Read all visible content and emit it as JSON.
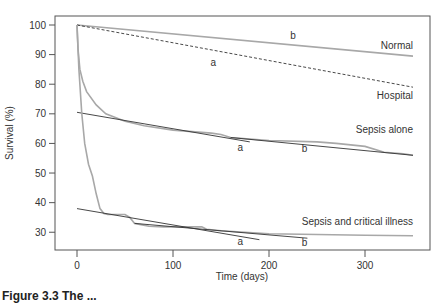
{
  "chart_data": {
    "type": "line",
    "title": "",
    "xlabel": "Time (days)",
    "ylabel": "Survival (%)",
    "xlim": [
      -20,
      366
    ],
    "ylim": [
      24.5,
      103
    ],
    "xticks": [
      0,
      100,
      200,
      300
    ],
    "yticks": [
      30,
      40,
      50,
      60,
      70,
      80,
      90,
      100
    ],
    "grid": false,
    "legend": "none (inline labels)",
    "series": [
      {
        "name": "Normal",
        "style": "solid-gray",
        "x": [
          0,
          350
        ],
        "y": [
          100,
          89.5
        ]
      },
      {
        "name": "Hospital",
        "style": "dashed-dark",
        "x": [
          0,
          350
        ],
        "y": [
          100,
          79
        ]
      },
      {
        "name": "Sepsis alone",
        "style": "solid-gray",
        "x": [
          0,
          1,
          3,
          6,
          10,
          20,
          30,
          50,
          70,
          100,
          140,
          150,
          160,
          200,
          250,
          270,
          300,
          320,
          340,
          350
        ],
        "y": [
          100,
          92,
          85,
          81,
          77.5,
          73,
          70,
          67.5,
          66,
          64.5,
          63.5,
          63,
          62,
          61,
          60.5,
          60,
          59,
          57,
          56.5,
          56
        ]
      },
      {
        "name": "Sepsis alone fit a",
        "style": "solid-dark",
        "x": [
          0,
          180
        ],
        "y": [
          70.5,
          60.5
        ]
      },
      {
        "name": "Sepsis alone fit b",
        "style": "solid-dark",
        "x": [
          160,
          350
        ],
        "y": [
          62,
          56
        ]
      },
      {
        "name": "Sepsis and critical illness",
        "style": "solid-gray",
        "x": [
          0,
          2,
          5,
          8,
          12,
          16,
          20,
          24,
          28,
          32,
          50,
          55,
          60,
          75,
          90,
          130,
          135,
          150,
          200,
          300,
          350
        ],
        "y": [
          100,
          85,
          70,
          60,
          53,
          49,
          43,
          38,
          36.3,
          36,
          36,
          35,
          33,
          32,
          31.8,
          31.8,
          31,
          30.5,
          29.5,
          29,
          28.8
        ]
      },
      {
        "name": "Sepsis and critical illness fit a",
        "style": "solid-dark",
        "x": [
          0,
          190
        ],
        "y": [
          38,
          27.5
        ]
      },
      {
        "name": "Sepsis and critical illness fit b",
        "style": "solid-dark",
        "x": [
          60,
          240
        ],
        "y": [
          33,
          28
        ]
      }
    ],
    "annotations": [
      {
        "text": "Normal",
        "x": 350,
        "y": 92,
        "anchor": "end"
      },
      {
        "text": "b",
        "x": 225,
        "y": 95.3,
        "anchor": "middle"
      },
      {
        "text": "a",
        "x": 142,
        "y": 86,
        "anchor": "middle"
      },
      {
        "text": "Hospital",
        "x": 350,
        "y": 75,
        "anchor": "end"
      },
      {
        "text": "Sepsis alone",
        "x": 350,
        "y": 63.5,
        "anchor": "end"
      },
      {
        "text": "a",
        "x": 170,
        "y": 57.5,
        "anchor": "middle"
      },
      {
        "text": "b",
        "x": 237,
        "y": 57,
        "anchor": "middle"
      },
      {
        "text": "Sepsis and critical illness",
        "x": 350,
        "y": 32.5,
        "anchor": "end"
      },
      {
        "text": "a",
        "x": 170,
        "y": 25.8,
        "anchor": "middle"
      },
      {
        "text": "b",
        "x": 237,
        "y": 25.3,
        "anchor": "middle"
      }
    ]
  },
  "caption": "Figure 3.3 The ..."
}
